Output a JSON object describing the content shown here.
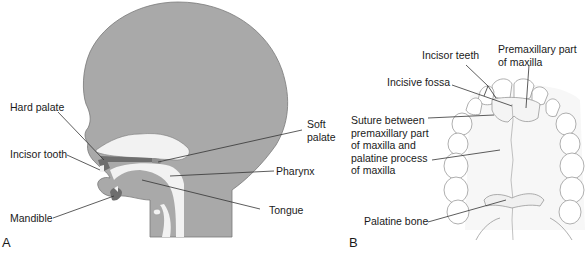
{
  "figure": {
    "panel_a": {
      "letter": "A",
      "labels": {
        "hard_palate": "Hard palate",
        "incisor_tooth": "Incisor tooth",
        "mandible": "Mandible",
        "soft_palate_line1": "Soft",
        "soft_palate_line2": "palate",
        "pharynx": "Pharynx",
        "tongue": "Tongue"
      }
    },
    "panel_b": {
      "letter": "B",
      "labels": {
        "incisor_teeth": "Incisor teeth",
        "premaxillary_line1": "Premaxillary part",
        "premaxillary_line2": "of maxilla",
        "incisive_fossa": "Incisive fossa",
        "suture_line1": "Suture between",
        "suture_line2": "premaxillary part",
        "suture_line3": "of maxilla and",
        "suture_line4": "palatine process",
        "suture_line5": "of maxilla",
        "palatine_bone": "Palatine bone"
      }
    },
    "colors": {
      "head_fill": "#a9a9a9",
      "head_stroke": "#7a7a7a",
      "dark_structure": "#6e6e6e",
      "arch_stroke": "#8c8c8c",
      "leader_line": "#333333"
    }
  }
}
